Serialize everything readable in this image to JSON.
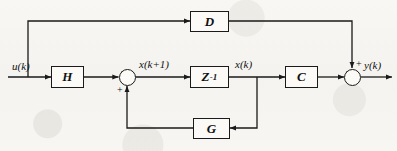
{
  "diagram": {
    "stroke_color": "#1a1a1a",
    "background_color": "#f7f6f2",
    "blocks": [
      {
        "id": "H",
        "label": "H",
        "name": "input-gain-block-h"
      },
      {
        "id": "Z",
        "label": "Z",
        "exponent": "-1",
        "name": "unit-delay-block"
      },
      {
        "id": "C",
        "label": "C",
        "name": "output-gain-block-c"
      },
      {
        "id": "D",
        "label": "D",
        "name": "feedforward-block-d"
      },
      {
        "id": "G",
        "label": "G",
        "name": "feedback-block-g"
      }
    ],
    "summing_junctions": [
      {
        "id": "state-sum",
        "signs": [
          "+"
        ],
        "name": "state-summing-junction"
      },
      {
        "id": "output-sum",
        "signs": [
          "+"
        ],
        "name": "output-summing-junction"
      }
    ],
    "signals": {
      "input": "u(k)",
      "state_next": "x(k+1)",
      "state": "x(k)",
      "output": "y(k)"
    },
    "signs": {
      "state_sum_plus": "+",
      "output_sum_plus": "+"
    }
  }
}
